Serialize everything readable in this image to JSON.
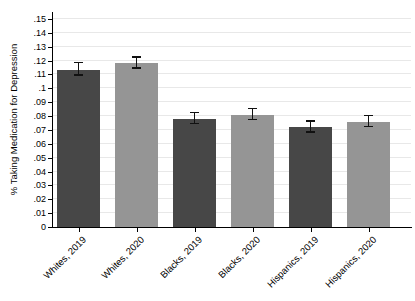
{
  "chart_data": {
    "type": "bar",
    "title": "",
    "xlabel": "",
    "ylabel": "% Taking Medication for Depression",
    "ylim": [
      0,
      0.155
    ],
    "grid": true,
    "legend": "none",
    "yticks": [
      {
        "v": 0,
        "label": "0"
      },
      {
        "v": 0.01,
        "label": ".01"
      },
      {
        "v": 0.02,
        "label": ".02"
      },
      {
        "v": 0.03,
        "label": ".03"
      },
      {
        "v": 0.04,
        "label": ".04"
      },
      {
        "v": 0.05,
        "label": ".05"
      },
      {
        "v": 0.06,
        "label": ".06"
      },
      {
        "v": 0.07,
        "label": ".07"
      },
      {
        "v": 0.08,
        "label": ".08"
      },
      {
        "v": 0.09,
        "label": ".09"
      },
      {
        "v": 0.1,
        "label": ".1"
      },
      {
        "v": 0.11,
        "label": ".11"
      },
      {
        "v": 0.12,
        "label": ".12"
      },
      {
        "v": 0.13,
        "label": ".13"
      },
      {
        "v": 0.14,
        "label": ".14"
      },
      {
        "v": 0.15,
        "label": ".15"
      }
    ],
    "bars": [
      {
        "label": "Whites, 2019",
        "value": 0.113,
        "ci_low": 0.109,
        "ci_high": 0.118,
        "shade": "dark"
      },
      {
        "label": "Whites, 2020",
        "value": 0.118,
        "ci_low": 0.114,
        "ci_high": 0.122,
        "shade": "light"
      },
      {
        "label": "Blacks, 2019",
        "value": 0.078,
        "ci_low": 0.074,
        "ci_high": 0.082,
        "shade": "dark"
      },
      {
        "label": "Blacks, 2020",
        "value": 0.081,
        "ci_low": 0.077,
        "ci_high": 0.085,
        "shade": "light"
      },
      {
        "label": "Hispanics, 2019",
        "value": 0.072,
        "ci_low": 0.068,
        "ci_high": 0.076,
        "shade": "dark"
      },
      {
        "label": "Hispanics, 2020",
        "value": 0.076,
        "ci_low": 0.072,
        "ci_high": 0.08,
        "shade": "light"
      }
    ],
    "colors": {
      "dark": "#474747",
      "light": "#959595",
      "error": "#111111",
      "grid": "#e8e8e8",
      "axis": "#000000"
    }
  }
}
